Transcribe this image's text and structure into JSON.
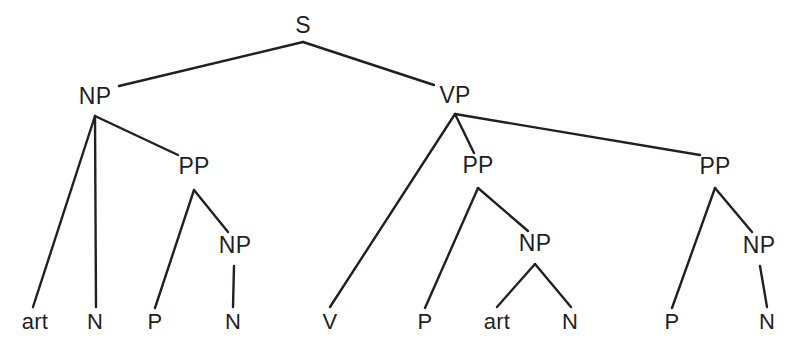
{
  "figure": {
    "name": "syntactic-phrase-structure-tree",
    "background_color": "#ffffff",
    "line_color": "#231f20",
    "text_color": "#231f20",
    "line_width": 2.4,
    "width": 794,
    "height": 354
  },
  "nodes": [
    {
      "id": "s",
      "label": "S",
      "x": 303,
      "y": 25,
      "apex_y": 42,
      "level": "root",
      "leaf": false
    },
    {
      "id": "np1",
      "label": "NP",
      "x": 95,
      "y": 96,
      "apex_y": 116,
      "level": "phrase",
      "leaf": false
    },
    {
      "id": "vp",
      "label": "VP",
      "x": 455,
      "y": 95,
      "apex_y": 114,
      "level": "phrase",
      "leaf": false
    },
    {
      "id": "pp1",
      "label": "PP",
      "x": 194,
      "y": 166,
      "apex_y": 190,
      "level": "phrase",
      "leaf": false
    },
    {
      "id": "pp2",
      "label": "PP",
      "x": 478,
      "y": 165,
      "apex_y": 188,
      "level": "phrase",
      "leaf": false
    },
    {
      "id": "pp3",
      "label": "PP",
      "x": 715,
      "y": 166,
      "apex_y": 188,
      "level": "phrase",
      "leaf": false
    },
    {
      "id": "np2",
      "label": "NP",
      "x": 235,
      "y": 245,
      "apex_y": 266,
      "level": "phrase",
      "leaf": false
    },
    {
      "id": "np3",
      "label": "NP",
      "x": 535,
      "y": 243,
      "apex_y": 264,
      "level": "phrase",
      "leaf": false
    },
    {
      "id": "np4",
      "label": "NP",
      "x": 759,
      "y": 245,
      "apex_y": 266,
      "level": "phrase",
      "leaf": false
    },
    {
      "id": "art1",
      "label": "art",
      "x": 35,
      "y": 322,
      "level": "terminal",
      "leaf": true
    },
    {
      "id": "n1",
      "label": "N",
      "x": 95,
      "y": 322,
      "level": "terminal",
      "leaf": true
    },
    {
      "id": "p1",
      "label": "P",
      "x": 155,
      "y": 322,
      "level": "terminal",
      "leaf": true
    },
    {
      "id": "n2",
      "label": "N",
      "x": 233,
      "y": 322,
      "level": "terminal",
      "leaf": true
    },
    {
      "id": "v1",
      "label": "V",
      "x": 330,
      "y": 322,
      "level": "terminal",
      "leaf": true
    },
    {
      "id": "p2",
      "label": "P",
      "x": 425,
      "y": 322,
      "level": "terminal",
      "leaf": true
    },
    {
      "id": "art2",
      "label": "art",
      "x": 497,
      "y": 322,
      "level": "terminal",
      "leaf": true
    },
    {
      "id": "n3",
      "label": "N",
      "x": 570,
      "y": 322,
      "level": "terminal",
      "leaf": true
    },
    {
      "id": "p3",
      "label": "P",
      "x": 672,
      "y": 322,
      "level": "terminal",
      "leaf": true
    },
    {
      "id": "n4",
      "label": "N",
      "x": 767,
      "y": 322,
      "level": "terminal",
      "leaf": true
    }
  ],
  "edges": [
    {
      "id": "s-np1",
      "from": "s",
      "to": "np1",
      "x1": 303,
      "y1": 42,
      "x2": 119,
      "y2": 86
    },
    {
      "id": "s-vp",
      "from": "s",
      "to": "vp",
      "x1": 303,
      "y1": 42,
      "x2": 434,
      "y2": 85
    },
    {
      "id": "np1-art1",
      "from": "np1",
      "to": "art1",
      "x1": 95,
      "y1": 116,
      "x2": 33,
      "y2": 307
    },
    {
      "id": "np1-n1",
      "from": "np1",
      "to": "n1",
      "x1": 95,
      "y1": 116,
      "x2": 96,
      "y2": 307
    },
    {
      "id": "np1-pp1",
      "from": "np1",
      "to": "pp1",
      "x1": 95,
      "y1": 116,
      "x2": 178,
      "y2": 155
    },
    {
      "id": "pp1-p1",
      "from": "pp1",
      "to": "p1",
      "x1": 194,
      "y1": 190,
      "x2": 155,
      "y2": 308
    },
    {
      "id": "pp1-np2",
      "from": "pp1",
      "to": "np2",
      "x1": 194,
      "y1": 190,
      "x2": 228,
      "y2": 232
    },
    {
      "id": "np2-n2",
      "from": "np2",
      "to": "n2",
      "x1": 234,
      "y1": 266,
      "x2": 233,
      "y2": 307
    },
    {
      "id": "vp-v1",
      "from": "vp",
      "to": "v1",
      "x1": 455,
      "y1": 114,
      "x2": 330,
      "y2": 307
    },
    {
      "id": "vp-pp2",
      "from": "vp",
      "to": "pp2",
      "x1": 455,
      "y1": 114,
      "x2": 474,
      "y2": 153
    },
    {
      "id": "vp-pp3",
      "from": "vp",
      "to": "pp3",
      "x1": 455,
      "y1": 114,
      "x2": 700,
      "y2": 155
    },
    {
      "id": "pp2-p2",
      "from": "pp2",
      "to": "p2",
      "x1": 478,
      "y1": 188,
      "x2": 425,
      "y2": 308
    },
    {
      "id": "pp2-np3",
      "from": "pp2",
      "to": "np3",
      "x1": 478,
      "y1": 188,
      "x2": 528,
      "y2": 231
    },
    {
      "id": "np3-art2",
      "from": "np3",
      "to": "art2",
      "x1": 535,
      "y1": 264,
      "x2": 497,
      "y2": 307
    },
    {
      "id": "np3-n3",
      "from": "np3",
      "to": "n3",
      "x1": 535,
      "y1": 264,
      "x2": 571,
      "y2": 307
    },
    {
      "id": "pp3-p3",
      "from": "pp3",
      "to": "p3",
      "x1": 715,
      "y1": 188,
      "x2": 672,
      "y2": 308
    },
    {
      "id": "pp3-np4",
      "from": "pp3",
      "to": "np4",
      "x1": 715,
      "y1": 188,
      "x2": 752,
      "y2": 232
    },
    {
      "id": "np4-n4",
      "from": "np4",
      "to": "n4",
      "x1": 760,
      "y1": 266,
      "x2": 767,
      "y2": 307
    }
  ]
}
